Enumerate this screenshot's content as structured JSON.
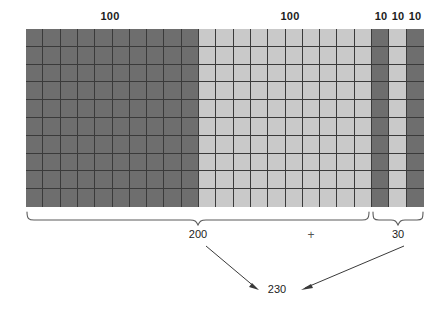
{
  "figure": {
    "grid": {
      "rows": 10,
      "columns": 23,
      "dark_color": "#6e6e6e",
      "light_color": "#c9c9c9",
      "gridline_color": "#3a3a3a",
      "column_shades": [
        "dark",
        "dark",
        "dark",
        "dark",
        "dark",
        "dark",
        "dark",
        "dark",
        "dark",
        "dark",
        "light",
        "light",
        "light",
        "light",
        "light",
        "light",
        "light",
        "light",
        "light",
        "light",
        "dark",
        "light",
        "dark"
      ]
    },
    "top_labels": [
      {
        "text": "100",
        "center_x": 110,
        "y": 10
      },
      {
        "text": "100",
        "center_x": 290,
        "y": 10
      },
      {
        "text": "10",
        "center_x": 381,
        "y": 10
      },
      {
        "text": "10",
        "center_x": 398,
        "y": 10
      },
      {
        "text": "10",
        "center_x": 415,
        "y": 10
      }
    ],
    "braces": [
      {
        "name": "hundreds-brace",
        "left_x": 26,
        "right_x": 370,
        "label": "200",
        "label_center_x": 198,
        "label_y": 228
      },
      {
        "name": "tens-brace",
        "left_x": 372,
        "right_x": 424,
        "label": "30",
        "label_center_x": 398,
        "label_y": 228
      }
    ],
    "operator": {
      "text": "+",
      "center_x": 311,
      "y": 230
    },
    "sum": {
      "text": "230",
      "center_x": 277,
      "y": 289
    },
    "arrows": [
      {
        "name": "arrow-from-200",
        "x1": 206,
        "y1": 245,
        "x2": 258,
        "y2": 290
      },
      {
        "name": "arrow-from-30",
        "x1": 403,
        "y1": 245,
        "x2": 302,
        "y2": 290
      }
    ]
  }
}
